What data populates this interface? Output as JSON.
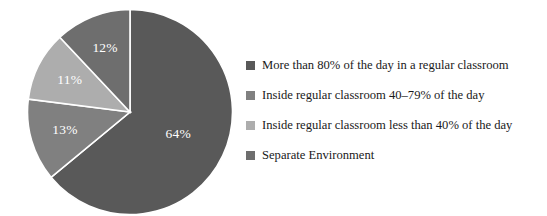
{
  "chart_data": {
    "type": "pie",
    "title": "",
    "subtitle": "",
    "xlabel": "",
    "ylabel": "",
    "grid": false,
    "legend_position": "right",
    "start_angle_deg": 0,
    "direction": "clockwise",
    "categories": [
      "More than 80% of the day in a regular classroom",
      "Inside regular classroom 40–79% of the day",
      "Inside regular classroom less than 40% of the day",
      "Separate Environment"
    ],
    "values": [
      64,
      13,
      11,
      12
    ],
    "value_labels": [
      "64%",
      "13%",
      "11%",
      "12%"
    ],
    "colors": [
      "#595959",
      "#808080",
      "#adadad",
      "#6e6e6e"
    ],
    "slice_separator_color": "#ffffff",
    "label_text_color": "#ffffff"
  },
  "slices": [
    {
      "label": "64%",
      "value": 64,
      "color": "#595959"
    },
    {
      "label": "13%",
      "value": 13,
      "color": "#808080"
    },
    {
      "label": "11%",
      "value": 11,
      "color": "#adadad"
    },
    {
      "label": "12%",
      "value": 12,
      "color": "#6e6e6e"
    }
  ],
  "legend": {
    "items": [
      {
        "label": "More than 80% of the day in a regular classroom",
        "color": "#595959"
      },
      {
        "label": "Inside regular classroom 40–79% of the day",
        "color": "#808080"
      },
      {
        "label": "Inside regular classroom less than 40% of the day",
        "color": "#adadad"
      },
      {
        "label": "Separate Environment",
        "color": "#6e6e6e"
      }
    ]
  }
}
